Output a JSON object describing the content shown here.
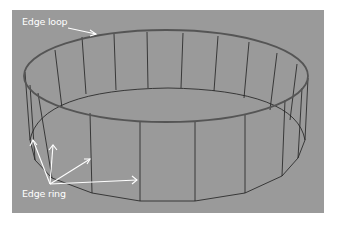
{
  "figure": {
    "background_color": "#9a9a9a",
    "labels": {
      "edge_loop": "Edge loop",
      "edge_ring": "Edge ring"
    },
    "colors": {
      "edge_loop_highlight": "#5a5a5a",
      "wire": "#1e1e1e",
      "annotation": "#ffffff"
    }
  }
}
